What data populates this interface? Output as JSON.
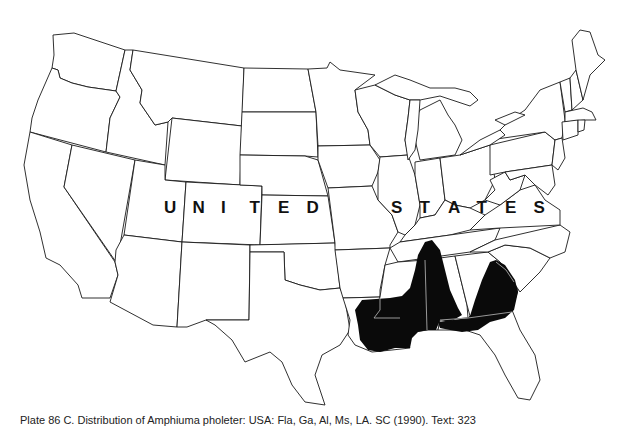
{
  "map": {
    "country_label": "UNITED STATES",
    "country_label_letters": [
      "U",
      "N",
      "I",
      "T",
      "E",
      "D",
      " ",
      "S",
      "T",
      "A",
      "T",
      "E",
      "S"
    ],
    "distribution": {
      "fill_color": "#0a0a0a",
      "regions_covered": [
        "Louisiana",
        "Mississippi",
        "Alabama",
        "Georgia",
        "Florida panhandle",
        "South Carolina (border)"
      ]
    },
    "outline_color": "#1a1a1a",
    "background_color": "#ffffff"
  },
  "caption": {
    "text": "Plate 86 C. Distribution of Amphiuma pholeter: USA: Fla, Ga, Al, Ms, LA. SC (1990). Text: 323"
  }
}
